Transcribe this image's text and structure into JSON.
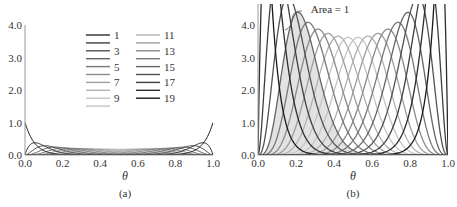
{
  "chart_data": [
    {
      "panel": "(a)",
      "type": "line",
      "description": "Bernstein basis polynomials of degree 19, B_k(θ) = C(19,k) θ^k (1-θ)^(19-k)",
      "degree": 19,
      "normalized": false,
      "xlabel": "θ",
      "ylabel": "",
      "xlim": [
        0.0,
        1.0
      ],
      "ylim": [
        0.0,
        4.0
      ],
      "xticks": [
        "0.0",
        "0.2",
        "0.4",
        "0.6",
        "0.8",
        "1.0"
      ],
      "yticks": [
        "0.0",
        "1.0",
        "2.0",
        "3.0",
        "4.0"
      ],
      "legend": {
        "position": "upper-center",
        "columns": 2,
        "labels_col1": [
          "1",
          "",
          "3",
          "",
          "5",
          "",
          "7",
          "",
          "9",
          ""
        ],
        "labels_col2": [
          "11",
          "",
          "13",
          "",
          "15",
          "",
          "17",
          "",
          "19"
        ]
      },
      "series_peaks": {
        "k1_at_0.05": 0.377,
        "middle_k10_at_0.5": 0.176
      },
      "caption": "(a)"
    },
    {
      "panel": "(b)",
      "type": "line",
      "description": "Normalized Bernstein basis (beta densities), 20·C(19,k) θ^k (1-θ)^(19-k), each with area 1; k=4 curve shaded",
      "degree": 19,
      "normalized": true,
      "xlabel": "θ",
      "ylabel": "",
      "xlim": [
        0.0,
        1.0
      ],
      "ylim": [
        0.0,
        4.6
      ],
      "xticks": [
        "0.0",
        "0.2",
        "0.4",
        "0.6",
        "0.8",
        "1.0"
      ],
      "yticks": [
        "0.0",
        "1.0",
        "2.0",
        "3.0",
        "4.0"
      ],
      "annotation": "Area = 1",
      "shaded_series_k": 4,
      "series_peaks": {
        "k4_at_0.21": 4.6,
        "k10_at_0.5": 3.5
      },
      "caption": "(b)"
    }
  ],
  "colors": {
    "dark": "#222222",
    "light": "#c8c8c8",
    "shade": "#e2e2e2",
    "axis": "#999999"
  }
}
